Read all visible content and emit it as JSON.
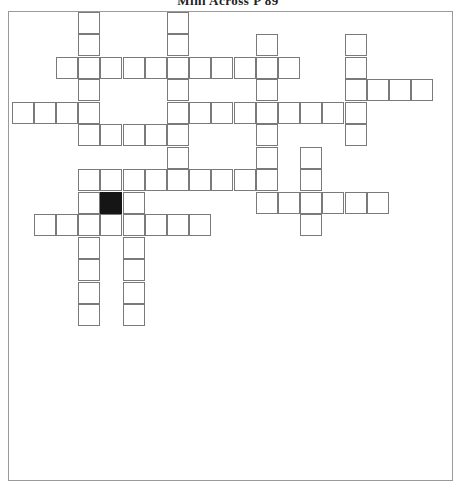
{
  "title": "Mini Across P 89",
  "grid": {
    "cell_size": 22.2,
    "rows": 14,
    "cols": 19,
    "colors": {
      "line": "#7a7a7a",
      "block": "#151515",
      "cell": "#ffffff"
    },
    "cells": [
      {
        "r": 0,
        "c": 3
      },
      {
        "r": 0,
        "c": 7
      },
      {
        "r": 1,
        "c": 3
      },
      {
        "r": 1,
        "c": 7
      },
      {
        "r": 1,
        "c": 11
      },
      {
        "r": 1,
        "c": 15
      },
      {
        "r": 2,
        "c": 2
      },
      {
        "r": 2,
        "c": 3
      },
      {
        "r": 2,
        "c": 4
      },
      {
        "r": 2,
        "c": 5
      },
      {
        "r": 2,
        "c": 6
      },
      {
        "r": 2,
        "c": 7
      },
      {
        "r": 2,
        "c": 8
      },
      {
        "r": 2,
        "c": 9
      },
      {
        "r": 2,
        "c": 10
      },
      {
        "r": 2,
        "c": 11
      },
      {
        "r": 2,
        "c": 12
      },
      {
        "r": 2,
        "c": 15
      },
      {
        "r": 3,
        "c": 3
      },
      {
        "r": 3,
        "c": 7
      },
      {
        "r": 3,
        "c": 11
      },
      {
        "r": 3,
        "c": 15
      },
      {
        "r": 3,
        "c": 16
      },
      {
        "r": 3,
        "c": 17
      },
      {
        "r": 3,
        "c": 18
      },
      {
        "r": 4,
        "c": 0
      },
      {
        "r": 4,
        "c": 1
      },
      {
        "r": 4,
        "c": 2
      },
      {
        "r": 4,
        "c": 3
      },
      {
        "r": 4,
        "c": 7
      },
      {
        "r": 4,
        "c": 8
      },
      {
        "r": 4,
        "c": 9
      },
      {
        "r": 4,
        "c": 10
      },
      {
        "r": 4,
        "c": 11
      },
      {
        "r": 4,
        "c": 12
      },
      {
        "r": 4,
        "c": 13
      },
      {
        "r": 4,
        "c": 14
      },
      {
        "r": 4,
        "c": 15
      },
      {
        "r": 5,
        "c": 3
      },
      {
        "r": 5,
        "c": 4
      },
      {
        "r": 5,
        "c": 5
      },
      {
        "r": 5,
        "c": 6
      },
      {
        "r": 5,
        "c": 7
      },
      {
        "r": 5,
        "c": 11
      },
      {
        "r": 5,
        "c": 15
      },
      {
        "r": 6,
        "c": 7
      },
      {
        "r": 6,
        "c": 11
      },
      {
        "r": 6,
        "c": 13
      },
      {
        "r": 7,
        "c": 3
      },
      {
        "r": 7,
        "c": 4
      },
      {
        "r": 7,
        "c": 5
      },
      {
        "r": 7,
        "c": 6
      },
      {
        "r": 7,
        "c": 7
      },
      {
        "r": 7,
        "c": 8
      },
      {
        "r": 7,
        "c": 9
      },
      {
        "r": 7,
        "c": 10
      },
      {
        "r": 7,
        "c": 11
      },
      {
        "r": 7,
        "c": 13
      },
      {
        "r": 8,
        "c": 3
      },
      {
        "r": 8,
        "c": 4,
        "block": true
      },
      {
        "r": 8,
        "c": 5
      },
      {
        "r": 8,
        "c": 11
      },
      {
        "r": 8,
        "c": 12
      },
      {
        "r": 8,
        "c": 13
      },
      {
        "r": 8,
        "c": 14
      },
      {
        "r": 8,
        "c": 15
      },
      {
        "r": 8,
        "c": 16
      },
      {
        "r": 9,
        "c": 1
      },
      {
        "r": 9,
        "c": 2
      },
      {
        "r": 9,
        "c": 3
      },
      {
        "r": 9,
        "c": 4
      },
      {
        "r": 9,
        "c": 5
      },
      {
        "r": 9,
        "c": 6
      },
      {
        "r": 9,
        "c": 7
      },
      {
        "r": 9,
        "c": 8
      },
      {
        "r": 9,
        "c": 13
      },
      {
        "r": 10,
        "c": 3
      },
      {
        "r": 10,
        "c": 5
      },
      {
        "r": 11,
        "c": 3
      },
      {
        "r": 11,
        "c": 5
      },
      {
        "r": 12,
        "c": 3
      },
      {
        "r": 12,
        "c": 5
      },
      {
        "r": 13,
        "c": 3
      },
      {
        "r": 13,
        "c": 5
      }
    ]
  }
}
